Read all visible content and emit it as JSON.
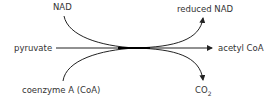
{
  "labels": {
    "nad": "NAD",
    "reduced_nad": "reduced NAD",
    "pyruvate": "pyruvate",
    "acetyl_coa": "acetyl CoA",
    "coenzyme_a": "coenzyme A (CoA)",
    "co2_main": "CO",
    "co2_sub": "2"
  },
  "colors": {
    "line": "#222222",
    "text": "#333333"
  }
}
